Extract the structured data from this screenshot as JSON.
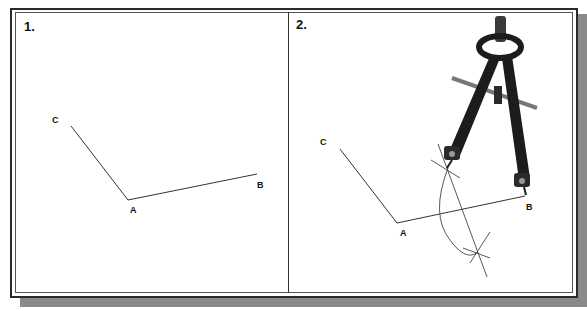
{
  "panels": [
    {
      "number": "1.",
      "points": {
        "C": {
          "label": "C",
          "x": 72,
          "y": 126
        },
        "A": {
          "label": "A",
          "x": 128,
          "y": 200
        },
        "B": {
          "label": "B",
          "x": 257,
          "y": 173
        }
      }
    },
    {
      "number": "2.",
      "points": {
        "C": {
          "label": "C",
          "x": 340,
          "y": 149
        },
        "A": {
          "label": "A",
          "x": 396,
          "y": 222
        },
        "B": {
          "label": "B",
          "x": 525,
          "y": 197
        }
      },
      "construction": "angle bisector with compass arcs",
      "tool": "drafting compass"
    }
  ],
  "colors": {
    "line": "#333333",
    "compass": "#1c1c1c",
    "shadow": "#8a8a8a"
  }
}
